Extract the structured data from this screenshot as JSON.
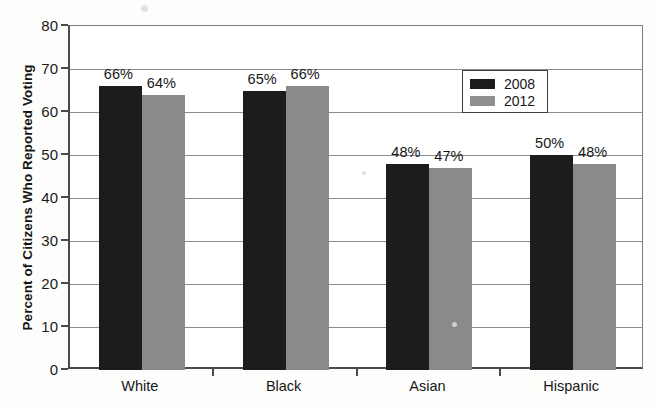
{
  "chart_data": {
    "type": "bar",
    "title": "",
    "subtitle": "",
    "xlabel": "",
    "ylabel": "Percent of Citizens Who Reported Voting",
    "categories": [
      "White",
      "Black",
      "Asian",
      "Hispanic"
    ],
    "series": [
      {
        "name": "2008",
        "color": "#1c1c1c",
        "values": [
          66,
          65,
          48,
          50
        ],
        "labels": [
          "66%",
          "65%",
          "48%",
          "50%"
        ]
      },
      {
        "name": "2012",
        "color": "#8a8a8a",
        "values": [
          64,
          66,
          47,
          48
        ],
        "labels": [
          "64%",
          "66%",
          "47%",
          "48%"
        ]
      }
    ],
    "ylim": [
      0,
      80
    ],
    "ytick_step": 10,
    "yticks": [
      0,
      10,
      20,
      30,
      40,
      50,
      60,
      70,
      80
    ],
    "ytick_labels": [
      "0",
      "10",
      "20",
      "30",
      "40",
      "50",
      "60",
      "70",
      "80"
    ],
    "grid": true,
    "grid_axis": "y",
    "legend_position": "top-right",
    "legend_entries": [
      "2008",
      "2012"
    ]
  },
  "axes": {
    "y_title": "Percent of Citizens Who Reported Voting"
  },
  "legend": {
    "entry_0": "2008",
    "entry_1": "2012"
  }
}
